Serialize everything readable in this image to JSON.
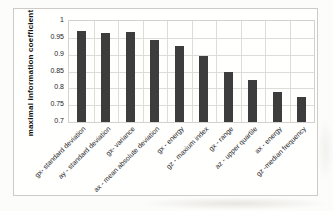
{
  "chart_data": {
    "type": "bar",
    "title": "",
    "xlabel": "",
    "ylabel": "maximal information coefficient",
    "ylim": [
      0.7,
      1.0
    ],
    "yticks": [
      "1",
      "0.95",
      "0.9",
      "0.85",
      "0.8",
      "0.75",
      "0.7"
    ],
    "grid": "both",
    "legend": "none",
    "bar_color": "#3d3d3d",
    "categories": [
      "gx- standard deviation",
      "ay - standard deviation",
      "gx- variance",
      "ax - mean absolute deviation",
      "gx - energy",
      "gz - maxium index",
      "gx - range",
      "az - upper quartile",
      "ax - energy",
      "gz -median frequency"
    ],
    "values": [
      0.971,
      0.964,
      0.966,
      0.945,
      0.925,
      0.897,
      0.85,
      0.824,
      0.79,
      0.774
    ]
  }
}
